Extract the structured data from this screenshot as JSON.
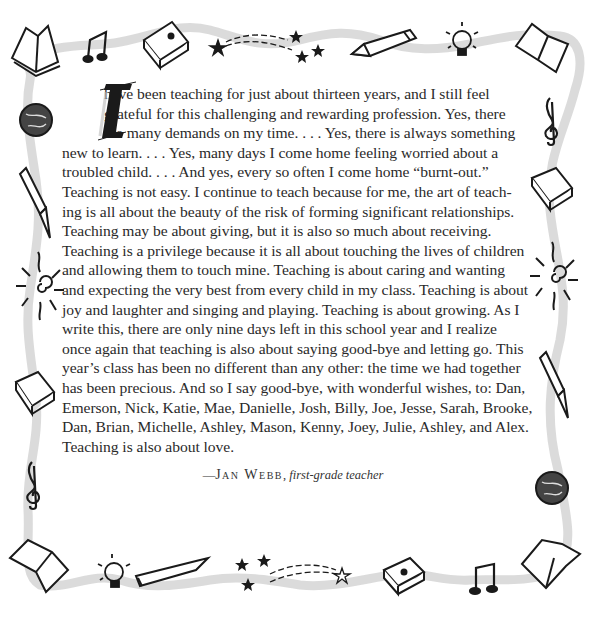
{
  "quote": {
    "drop_cap": "I",
    "lines": [
      "have been teaching for just about thirteen years, and I still feel",
      "grateful for this challenging and rewarding profession. Yes, there",
      "are many demands on my time. . . . Yes, there is always something",
      "new to learn. . . . Yes, many days I come home feeling worried about a",
      "troubled child. . . . And yes, every so often I come home “burnt-out.”",
      "Teaching is not easy. I continue to teach because for me, the art of teach-",
      "ing is all about the beauty of the risk of forming significant relationships.",
      "Teaching may be about giving, but it is also so much about receiving.",
      "Teaching is a privilege because it is all about touching the lives of children",
      "and allowing them to touch mine. Teaching is about caring and wanting",
      "and expecting the very best from every child in my class. Teaching is about",
      "joy and laughter and singing and playing. Teaching is about growing. As I",
      "write this, there are only nine days left in this school year and I realize",
      "once again that teaching is also about saying good-bye and letting go. This",
      "year’s class has been no different than any other: the time we had together",
      "has been precious. And so I say good-bye, with wonderful wishes, to: Dan,",
      "Emerson, Nick, Katie, Mae, Danielle, Josh, Billy, Joe, Jesse, Sarah, Brooke,",
      "Dan, Brian, Michelle, Ashley, Mason, Kenny, Joey, Julie, Ashley, and Alex.",
      "Teaching is also about love."
    ],
    "attribution": {
      "dash": "—",
      "name": "Jan Webb",
      "separator": ", ",
      "title": "first-grade teacher"
    }
  },
  "border": {
    "ribbon_color": "#d6d6d6",
    "ink_color": "#1a1a1a",
    "top_icons": [
      "open-book",
      "music-note",
      "closed-book",
      "shooting-star",
      "stars",
      "pencil",
      "light-bulb",
      "open-book"
    ],
    "left_icons": [
      "globe",
      "fountain-pen",
      "sun",
      "closed-book",
      "treble-clef"
    ],
    "right_icons": [
      "treble-clef",
      "closed-book",
      "sun",
      "fountain-pen",
      "globe"
    ],
    "bottom_icons": [
      "open-book",
      "light-bulb",
      "pencil",
      "stars",
      "shooting-star",
      "closed-book",
      "music-note",
      "open-book"
    ]
  }
}
